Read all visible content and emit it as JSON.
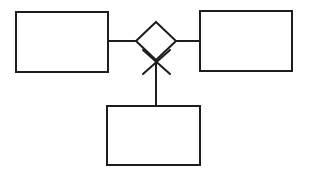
{
  "diagram": {
    "type": "entity-relationship-diagram",
    "background_color": "#ffffff",
    "stroke_color": "#1d1d1d",
    "fill_color": "#ffffff",
    "stroke_width": 2,
    "canvas": {
      "width": 314,
      "height": 174
    },
    "entities": [
      {
        "id": "entity-left",
        "label": "",
        "shape": "rectangle",
        "x": 16,
        "y": 12,
        "width": 92,
        "height": 60
      },
      {
        "id": "entity-right",
        "label": "",
        "shape": "rectangle",
        "x": 200,
        "y": 11,
        "width": 92,
        "height": 60
      },
      {
        "id": "entity-bottom",
        "label": "",
        "shape": "rectangle",
        "x": 107,
        "y": 106,
        "width": 93,
        "height": 59
      }
    ],
    "relationship": {
      "id": "relationship-diamond",
      "label": "",
      "shape": "diamond",
      "center_x": 156,
      "center_y": 41,
      "half_width": 20,
      "half_height": 19
    },
    "connectors": [
      {
        "id": "connector-left",
        "from": "entity-left",
        "to": "relationship-diamond",
        "orientation": "horizontal",
        "x1": 108,
        "y1": 41,
        "x2": 136,
        "y2": 41,
        "cardinality_marker": "none"
      },
      {
        "id": "connector-right",
        "from": "relationship-diamond",
        "to": "entity-right",
        "orientation": "horizontal",
        "x1": 176,
        "y1": 41,
        "x2": 200,
        "y2": 41,
        "cardinality_marker": "none"
      },
      {
        "id": "connector-bottom",
        "from": "relationship-diamond",
        "to": "entity-bottom",
        "orientation": "vertical",
        "x1": 156,
        "y1": 58,
        "x2": 156,
        "y2": 106,
        "cardinality_marker": "crows-foot-cross"
      }
    ],
    "markers": [
      {
        "id": "crows-foot-cross",
        "kind": "x-cross",
        "center_x": 156,
        "center_y": 61,
        "x1": 143,
        "y1": 50,
        "x2": 170,
        "y2": 74,
        "x3": 170,
        "y3": 50,
        "x4": 143,
        "y4": 74
      }
    ]
  }
}
